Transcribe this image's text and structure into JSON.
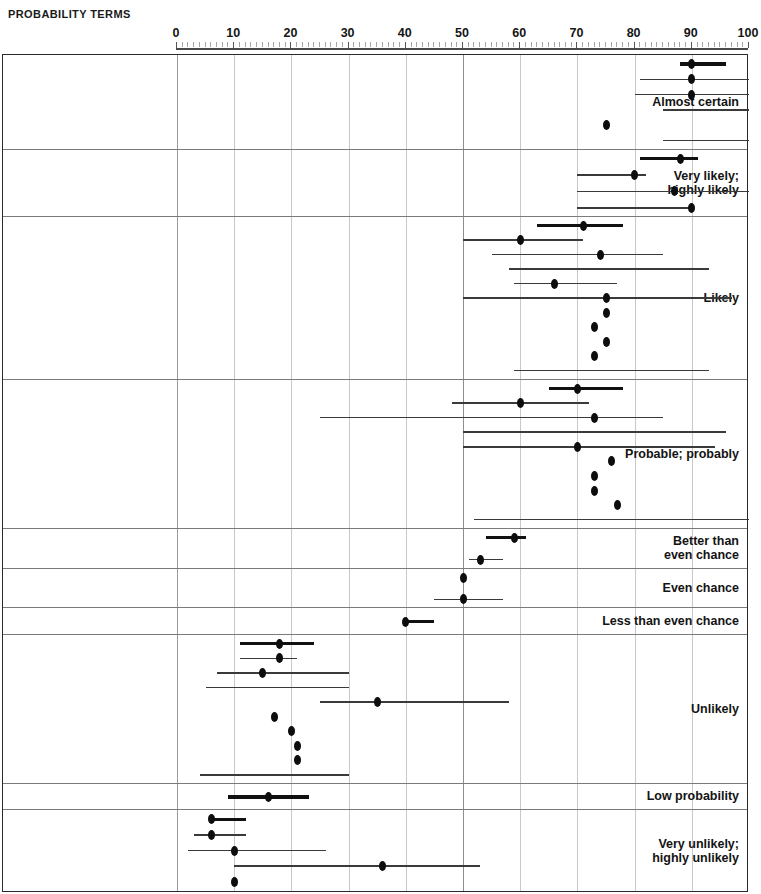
{
  "title": "PROBABILITY TERMS",
  "axis": {
    "ticks": [
      0,
      10,
      20,
      30,
      40,
      50,
      60,
      70,
      80,
      90,
      100
    ],
    "tick_labels": [
      "0",
      "10",
      "20",
      "30",
      "40",
      "50",
      "60",
      "70",
      "80",
      "90",
      "100"
    ],
    "min": 0,
    "max": 100
  },
  "chart_data": {
    "type": "scatter",
    "title": "PROBABILITY TERMS",
    "xlabel": "",
    "ylabel": "",
    "xlim": [
      0,
      100
    ],
    "grid": true,
    "legend": "none",
    "categories": [
      "Almost certain",
      "Very likely; highly likely",
      "Likely",
      "Probable; probably",
      "Better than even chance",
      "Even chance",
      "Less than even chance",
      "Unlikely",
      "Low probability",
      "Very unlikely; highly unlikely"
    ],
    "groups": [
      {
        "label": "Almost certain",
        "label_lines": "Almost certain",
        "rows": [
          {
            "point": 90,
            "low": 88,
            "high": 96,
            "thick": true
          },
          {
            "point": 90,
            "low": 81,
            "high": 100,
            "thick": false
          },
          {
            "point": 90,
            "low": 80,
            "high": 100,
            "thick": false
          },
          {
            "point": null,
            "low": 85,
            "high": 100,
            "thick": false
          },
          {
            "point": 75,
            "low": null,
            "high": null,
            "thick": false
          },
          {
            "point": null,
            "low": 85,
            "high": 100,
            "thick": false
          }
        ]
      },
      {
        "label": "Very likely; highly likely",
        "label_lines": "Very likely;\nhighly likely",
        "rows": [
          {
            "point": 88,
            "low": 81,
            "high": 91,
            "thick": true
          },
          {
            "point": 80,
            "low": 70,
            "high": 82,
            "thick": false
          },
          {
            "point": 87,
            "low": 70,
            "high": 100,
            "thick": false
          },
          {
            "point": 90,
            "low": 70,
            "high": 90,
            "thick": false
          }
        ]
      },
      {
        "label": "Likely",
        "label_lines": "Likely",
        "rows": [
          {
            "point": 71,
            "low": 63,
            "high": 78,
            "thick": true
          },
          {
            "point": 60,
            "low": 50,
            "high": 71,
            "thick": false
          },
          {
            "point": 74,
            "low": 55,
            "high": 85,
            "thick": false
          },
          {
            "point": null,
            "low": 58,
            "high": 93,
            "thick": false
          },
          {
            "point": 66,
            "low": 59,
            "high": 77,
            "thick": false
          },
          {
            "point": 75,
            "low": 50,
            "high": 97,
            "thick": false
          },
          {
            "point": 75,
            "low": null,
            "high": null,
            "thick": false
          },
          {
            "point": 73,
            "low": null,
            "high": null,
            "thick": false
          },
          {
            "point": 75,
            "low": null,
            "high": null,
            "thick": false
          },
          {
            "point": 73,
            "low": null,
            "high": null,
            "thick": false
          },
          {
            "point": null,
            "low": 59,
            "high": 93,
            "thick": false
          }
        ]
      },
      {
        "label": "Probable; probably",
        "label_lines": "Probable; probably",
        "rows": [
          {
            "point": 70,
            "low": 65,
            "high": 78,
            "thick": true
          },
          {
            "point": 60,
            "low": 48,
            "high": 72,
            "thick": false
          },
          {
            "point": 73,
            "low": 25,
            "high": 85,
            "thick": false
          },
          {
            "point": null,
            "low": 50,
            "high": 96,
            "thick": false
          },
          {
            "point": 70,
            "low": 50,
            "high": 94,
            "thick": false
          },
          {
            "point": 76,
            "low": null,
            "high": null,
            "thick": false
          },
          {
            "point": 73,
            "low": null,
            "high": null,
            "thick": false
          },
          {
            "point": 73,
            "low": null,
            "high": null,
            "thick": false
          },
          {
            "point": 77,
            "low": null,
            "high": null,
            "thick": false
          },
          {
            "point": null,
            "low": 52,
            "high": 100,
            "thick": false
          }
        ]
      },
      {
        "label": "Better than even chance",
        "label_lines": "Better than\neven chance",
        "rows": [
          {
            "point": 59,
            "low": 54,
            "high": 61,
            "thick": true
          },
          {
            "point": 53,
            "low": 51,
            "high": 57,
            "thick": false
          }
        ]
      },
      {
        "label": "Even chance",
        "label_lines": "Even chance",
        "rows": [
          {
            "point": 50,
            "low": null,
            "high": null,
            "thick": false
          },
          {
            "point": 50,
            "low": 45,
            "high": 57,
            "thick": false
          }
        ]
      },
      {
        "label": "Less than even chance",
        "label_lines": "Less than even chance",
        "rows": [
          {
            "point": 40,
            "low": 40,
            "high": 45,
            "thick": true
          }
        ]
      },
      {
        "label": "Unlikely",
        "label_lines": "Unlikely",
        "rows": [
          {
            "point": 18,
            "low": 11,
            "high": 24,
            "thick": true
          },
          {
            "point": 18,
            "low": 11,
            "high": 21,
            "thick": false
          },
          {
            "point": 15,
            "low": 7,
            "high": 30,
            "thick": false
          },
          {
            "point": null,
            "low": 5,
            "high": 30,
            "thick": false
          },
          {
            "point": 35,
            "low": 25,
            "high": 58,
            "thick": false
          },
          {
            "point": 17,
            "low": null,
            "high": null,
            "thick": false
          },
          {
            "point": 20,
            "low": null,
            "high": null,
            "thick": false
          },
          {
            "point": 21,
            "low": null,
            "high": null,
            "thick": false
          },
          {
            "point": 21,
            "low": null,
            "high": null,
            "thick": false
          },
          {
            "point": null,
            "low": 4,
            "high": 30,
            "thick": false
          }
        ]
      },
      {
        "label": "Low probability",
        "label_lines": "Low probability",
        "rows": [
          {
            "point": 16,
            "low": 9,
            "high": 23,
            "thick": true
          }
        ]
      },
      {
        "label": "Very unlikely; highly unlikely",
        "label_lines": "Very unlikely;\nhighly unlikely",
        "rows": [
          {
            "point": 6,
            "low": 6,
            "high": 12,
            "thick": true
          },
          {
            "point": 6,
            "low": 3,
            "high": 12,
            "thick": false
          },
          {
            "point": 10,
            "low": 2,
            "high": 26,
            "thick": false
          },
          {
            "point": 36,
            "low": 10,
            "high": 53,
            "thick": false
          },
          {
            "point": 10,
            "low": null,
            "high": null,
            "thick": false
          }
        ]
      }
    ]
  }
}
